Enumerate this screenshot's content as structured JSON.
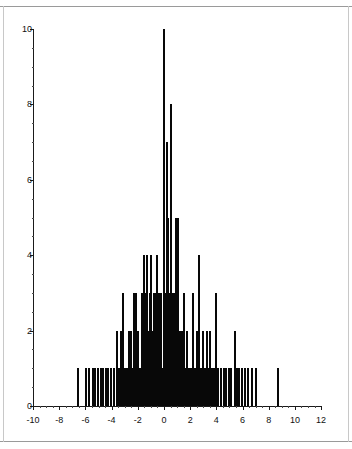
{
  "chart_data": {
    "type": "bar",
    "title": "",
    "subtitle": "",
    "xlabel": "",
    "ylabel": "",
    "xlim": [
      -10,
      12
    ],
    "ylim": [
      0,
      10
    ],
    "grid": false,
    "legend": null,
    "annotations": [],
    "x_tick_labels": [
      "-10",
      "-8",
      "-6",
      "-4",
      "-2",
      "0",
      "2",
      "4",
      "6",
      "8",
      "10",
      "12"
    ],
    "x_tick_values": [
      -10,
      -8,
      -6,
      -4,
      -2,
      0,
      2,
      4,
      6,
      8,
      10,
      12
    ],
    "x_minor_step": 0.5,
    "y_tick_labels": [
      "0",
      "2",
      "4",
      "6",
      "8",
      "10"
    ],
    "y_tick_values": [
      0,
      2,
      4,
      6,
      8,
      10
    ],
    "y_minor_step": 0.5,
    "bar_color": "#080808",
    "axis_color": "#1a1a1a",
    "background_color": "#ffffff",
    "x": [
      -6.55,
      -5.95,
      -5.75,
      -5.45,
      -5.25,
      -5.05,
      -4.85,
      -4.65,
      -4.45,
      -4.25,
      -4.05,
      -3.85,
      -3.6,
      -3.45,
      -3.25,
      -3.1,
      -3.0,
      -2.85,
      -2.7,
      -2.55,
      -2.45,
      -2.3,
      -2.15,
      -2.05,
      -1.95,
      -1.85,
      -1.7,
      -1.6,
      -1.5,
      -1.4,
      -1.3,
      -1.2,
      -1.1,
      -1.0,
      -0.9,
      -0.8,
      -0.7,
      -0.6,
      -0.5,
      -0.4,
      -0.3,
      -0.2,
      -0.1,
      0.0,
      0.1,
      0.2,
      0.3,
      0.4,
      0.5,
      0.6,
      0.7,
      0.8,
      0.9,
      1.0,
      1.1,
      1.2,
      1.35,
      1.5,
      1.6,
      1.75,
      1.9,
      2.05,
      2.2,
      2.35,
      2.5,
      2.65,
      2.8,
      2.95,
      3.1,
      3.25,
      3.4,
      3.55,
      3.7,
      3.85,
      4.0,
      4.15,
      4.35,
      4.55,
      4.75,
      4.95,
      5.15,
      5.4,
      5.6,
      5.75,
      5.95,
      6.2,
      6.45,
      6.7,
      7.0,
      8.7
    ],
    "values": [
      1,
      1,
      1,
      1,
      1,
      1,
      1,
      1,
      1,
      1,
      1,
      1,
      2,
      1,
      2,
      3,
      1,
      1,
      2,
      2,
      1,
      3,
      3,
      1,
      2,
      1,
      3,
      2,
      4,
      3,
      4,
      2,
      3,
      4,
      2,
      3,
      3,
      2,
      4,
      3,
      2,
      3,
      1,
      10,
      3,
      7,
      5,
      3,
      8,
      2,
      3,
      3,
      5,
      3,
      5,
      2,
      2,
      3,
      1,
      2,
      1,
      1,
      3,
      1,
      2,
      4,
      1,
      2,
      1,
      2,
      1,
      2,
      1,
      1,
      3,
      1,
      1,
      1,
      1,
      1,
      1,
      2,
      1,
      1,
      1,
      1,
      1,
      1,
      1,
      1
    ],
    "bar_width_units": 0.1,
    "n_bars": 90,
    "distribution_note": "approximately symmetric unimodal spike histogram centred near 0"
  }
}
